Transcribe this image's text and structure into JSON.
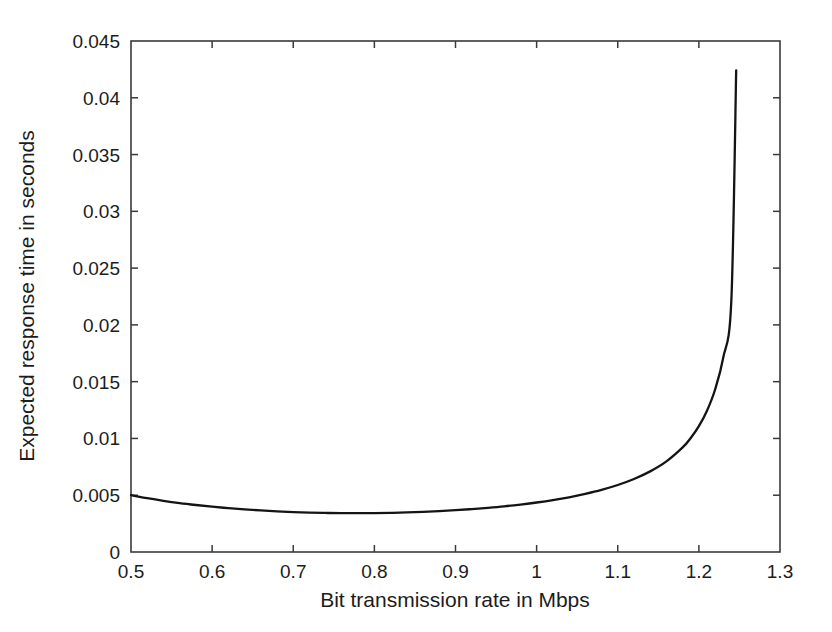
{
  "chart_data": {
    "type": "line",
    "title": "",
    "xlabel": "Bit transmission rate in Mbps",
    "ylabel": "Expected response time in seconds",
    "xlim": [
      0.5,
      1.3
    ],
    "ylim": [
      0,
      0.045
    ],
    "grid": false,
    "legend": null,
    "xticks": [
      0.5,
      0.6,
      0.7,
      0.8,
      0.9,
      1.0,
      1.1,
      1.2,
      1.3
    ],
    "xtick_labels": [
      "0.5",
      "0.6",
      "0.7",
      "0.8",
      "0.9",
      "1",
      "1.1",
      "1.2",
      "1.3"
    ],
    "yticks": [
      0,
      0.005,
      0.01,
      0.015,
      0.02,
      0.025,
      0.03,
      0.035,
      0.04,
      0.045
    ],
    "ytick_labels": [
      "0",
      "0.005",
      "0.01",
      "0.015",
      "0.02",
      "0.025",
      "0.03",
      "0.035",
      "0.04",
      "0.045"
    ],
    "series": [
      {
        "name": "Expected response time",
        "color": "#141414",
        "x": [
          0.5,
          0.52,
          0.54,
          0.56,
          0.58,
          0.6,
          0.62,
          0.64,
          0.66,
          0.68,
          0.7,
          0.72,
          0.74,
          0.76,
          0.78,
          0.8,
          0.82,
          0.84,
          0.86,
          0.88,
          0.9,
          0.92,
          0.94,
          0.96,
          0.98,
          1.0,
          1.02,
          1.04,
          1.06,
          1.08,
          1.1,
          1.12,
          1.14,
          1.16,
          1.18,
          1.19,
          1.2,
          1.21,
          1.22,
          1.23,
          1.24,
          1.246
        ],
        "y": [
          0.005,
          0.00474,
          0.00451,
          0.00431,
          0.00414,
          0.00399,
          0.00386,
          0.00375,
          0.00366,
          0.00358,
          0.00352,
          0.00347,
          0.00344,
          0.00342,
          0.00342,
          0.00343,
          0.00345,
          0.00349,
          0.00354,
          0.0036,
          0.00368,
          0.00378,
          0.00389,
          0.00402,
          0.00418,
          0.00436,
          0.00457,
          0.00482,
          0.00512,
          0.00547,
          0.0059,
          0.00643,
          0.0071,
          0.00798,
          0.00921,
          0.01004,
          0.01108,
          0.01244,
          0.01431,
          0.0171,
          0.0221,
          0.0424
        ],
        "endpoint_value": 0.0424,
        "minimum": {
          "x": 0.76,
          "y": 0.00342
        },
        "start_point": {
          "x": 0.5,
          "y": 0.005
        }
      }
    ]
  },
  "figure": {
    "background_color": "#ffffff",
    "axis_color": "#3a3a3a",
    "curve_color": "#141414"
  }
}
